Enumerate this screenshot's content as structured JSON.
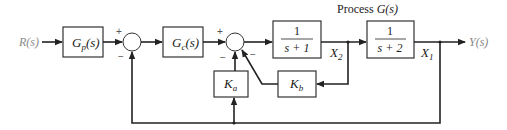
{
  "diagram": {
    "title": "Process G(s)",
    "title_prefix": "Process ",
    "title_func": "G(s)",
    "input_label": "R(s)",
    "output_label": "Y(s)",
    "blocks": {
      "prefilter": {
        "name": "G",
        "sub": "p",
        "arg": "(s)"
      },
      "controller": {
        "name": "G",
        "sub": "c",
        "arg": "(s)"
      },
      "plant1": {
        "numerator": "1",
        "denominator": "s + 1"
      },
      "plant2": {
        "numerator": "1",
        "denominator": "s + 2"
      },
      "gain_a": {
        "name": "K",
        "sub": "a"
      },
      "gain_b": {
        "name": "K",
        "sub": "b"
      }
    },
    "signals": {
      "x2": {
        "name": "X",
        "sub": "2"
      },
      "x1": {
        "name": "X",
        "sub": "1"
      }
    },
    "summing_junctions": [
      {
        "id": "sum1",
        "signs": [
          "+",
          "−"
        ]
      },
      {
        "id": "sum2",
        "signs": [
          "+",
          "−",
          "−"
        ]
      }
    ],
    "colors": {
      "line": "#222222",
      "io_text": "#888888"
    }
  }
}
